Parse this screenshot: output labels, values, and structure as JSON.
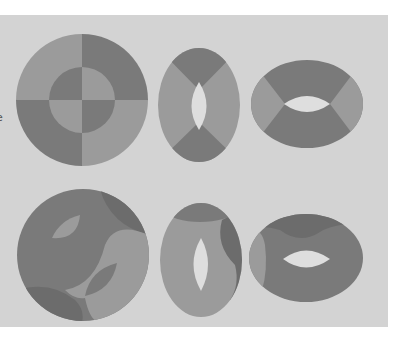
{
  "figure": {
    "background": "#d3d3d3",
    "page_background": "#ffffff",
    "colors": {
      "light": "#9b9b9b",
      "dark": "#7a7a7a",
      "darker": "#6c6c6c",
      "hole": "#dedede"
    },
    "clipped_left_text": [
      "e",
      "l"
    ],
    "rows": [
      {
        "label": "top-row",
        "shapes": [
          "segmented-disk",
          "vertical-torus-view",
          "horizontal-torus-view"
        ]
      },
      {
        "label": "bottom-row",
        "shapes": [
          "shaded-sphere-torus",
          "vertical-shaded-torus",
          "horizontal-shaded-torus"
        ]
      }
    ]
  }
}
